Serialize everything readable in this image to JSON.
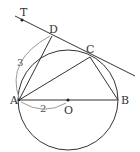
{
  "diagram": {
    "type": "geometry",
    "colors": {
      "line": "#333333",
      "arc": "#9a9a9a",
      "background": "#ffffff"
    },
    "circle": {
      "center": "O",
      "cx": 68,
      "cy": 100,
      "r": 50
    },
    "points": [
      {
        "name": "T",
        "label": "T",
        "x": 22,
        "y": 20
      },
      {
        "name": "D",
        "label": "D",
        "x": 52,
        "y": 36
      },
      {
        "name": "C",
        "label": "C",
        "x": 90,
        "y": 57
      },
      {
        "name": "A",
        "label": "A",
        "x": 19,
        "y": 100
      },
      {
        "name": "O",
        "label": "O",
        "x": 68,
        "y": 100
      },
      {
        "name": "B",
        "label": "B",
        "x": 118,
        "y": 100
      }
    ],
    "segments": [
      "TD-tangent",
      "AD",
      "AC",
      "CB",
      "AB"
    ],
    "dimensions": [
      {
        "between": "A-D",
        "value": "3"
      },
      {
        "between": "A-O",
        "value": "2"
      }
    ]
  }
}
